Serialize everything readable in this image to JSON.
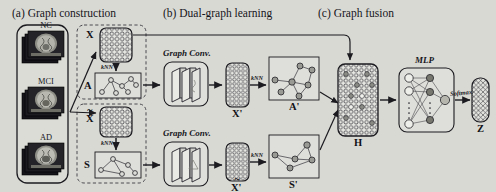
{
  "figure": {
    "background_color": "#d9d9d4",
    "ink_color": "#1b1b20",
    "panels": [
      {
        "id": "a",
        "title": "(a) Graph construction"
      },
      {
        "id": "b",
        "title": "(b) Dual-graph learning"
      },
      {
        "id": "c",
        "title": "(c) Graph fusion"
      }
    ]
  },
  "panel_a": {
    "mri_stacks": [
      {
        "label": "NC"
      },
      {
        "label": "MCI"
      },
      {
        "label": "AD"
      }
    ],
    "feature_matrix_top": {
      "label": "X"
    },
    "feature_matrix_bottom": {
      "label": "X",
      "accent": "~"
    },
    "adjacency_top": {
      "label": "A"
    },
    "adjacency_bottom": {
      "label": "S"
    },
    "knn_top": "kNN",
    "knn_bottom": "kNN"
  },
  "panel_b": {
    "branches": [
      {
        "conv_label": "Graph Conv.",
        "feature_label": "X",
        "feature_prime": "'",
        "knn_label": "kNN",
        "graph_label": "A",
        "graph_prime": "'"
      },
      {
        "conv_label": "Graph Conv.",
        "feature_label": "X",
        "feature_prime": "'",
        "feature_accent": "~",
        "knn_label": "kNN",
        "graph_label": "S",
        "graph_prime": "'"
      }
    ]
  },
  "panel_c": {
    "fused_matrix": {
      "label": "H"
    },
    "mlp": {
      "label": "MLP"
    },
    "softmax": {
      "label": "Softmax"
    },
    "output": {
      "label": "Z"
    }
  }
}
